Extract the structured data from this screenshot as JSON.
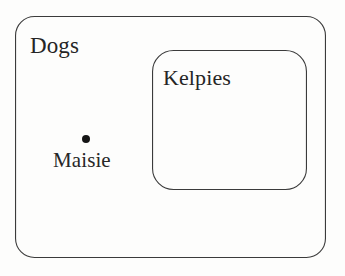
{
  "diagram": {
    "type": "euler-diagram",
    "width": 345,
    "height": 276,
    "background_color": "#fdfdfc",
    "stroke_color": "#3b3b3b",
    "stroke_width": 1.1,
    "sets": [
      {
        "name": "outer-set",
        "label": "Dogs",
        "shape": "rounded-rectangle",
        "x": 15,
        "y": 16,
        "width": 311,
        "height": 242,
        "corner_radius": 19,
        "label_x": 30,
        "label_y": 34,
        "font_size": 23
      },
      {
        "name": "inner-set",
        "label": "Kelpies",
        "shape": "rounded-rectangle",
        "x": 152,
        "y": 50,
        "width": 155,
        "height": 140,
        "corner_radius": 21,
        "label_x": 163,
        "label_y": 67,
        "font_size": 22
      }
    ],
    "points": [
      {
        "name": "element-maisie",
        "label": "Maisie",
        "center_x": 86,
        "center_y": 139,
        "radius": 4,
        "color": "#151515",
        "label_x": 53,
        "label_y": 150,
        "font_size": 21,
        "member_of": "Dogs"
      }
    ]
  }
}
